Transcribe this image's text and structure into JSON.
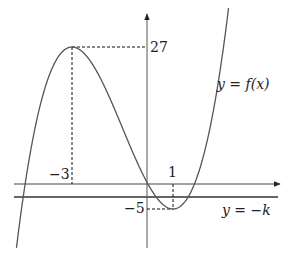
{
  "figure": {
    "function_label": "y = f(x)",
    "line_label": "y = −k",
    "max_point": {
      "x": -3,
      "y": 27,
      "x_label": "−3",
      "y_label": "27"
    },
    "min_point": {
      "x": 1,
      "y": -5,
      "x_label": "1",
      "y_label": "−5"
    },
    "colors": {
      "curve": "#555555",
      "axes": "#333333",
      "dashed": "#111111",
      "text": "#222222"
    }
  },
  "chart_data": {
    "type": "line",
    "title": "",
    "xlabel": "x",
    "ylabel": "y",
    "series": [
      {
        "name": "y = f(x)",
        "points": [
          [
            -5.3,
            -28
          ],
          [
            -4,
            20
          ],
          [
            -3,
            27
          ],
          [
            -2,
            22
          ],
          [
            -1,
            11
          ],
          [
            0,
            0
          ],
          [
            1,
            -5
          ],
          [
            2,
            2
          ],
          [
            2.5,
            11.4
          ],
          [
            3,
            27
          ]
        ]
      },
      {
        "name": "y = −k",
        "points": [
          [
            -5.3,
            -2.6
          ],
          [
            5.2,
            -2.6
          ]
        ]
      }
    ],
    "annotations": [
      {
        "text": "27",
        "at": [
          0,
          27
        ]
      },
      {
        "text": "−5",
        "at": [
          0,
          -5
        ]
      },
      {
        "text": "−3",
        "at": [
          -3,
          0
        ]
      },
      {
        "text": "1",
        "at": [
          1,
          0
        ]
      },
      {
        "text": "y = f(x)",
        "at": [
          2.8,
          17
        ]
      },
      {
        "text": "y = −k",
        "at": [
          3.6,
          -9
        ]
      }
    ],
    "grid": false
  }
}
